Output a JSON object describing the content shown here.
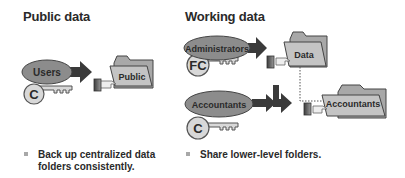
{
  "sections": {
    "public": {
      "heading": "Public data",
      "group_label": "Users",
      "permission_label": "C",
      "folder_label": "Public",
      "bullet": [
        "Back up centralized data",
        "folders consistently."
      ]
    },
    "working": {
      "heading": "Working data",
      "admin_group_label": "Administrators",
      "admin_permission_label": "FC",
      "data_folder_label": "Data",
      "acct_group_label": "Accountants",
      "acct_permission_label": "C",
      "acct_folder_label": "Accountants",
      "bullet": [
        "Share lower-level folders."
      ]
    }
  },
  "colors": {
    "ellipse": "#8c8c8c",
    "key": "#d8d8d8",
    "folder": "#bdbdbd",
    "arrow": "#3a3a3a",
    "text": "#2a2a2a"
  }
}
